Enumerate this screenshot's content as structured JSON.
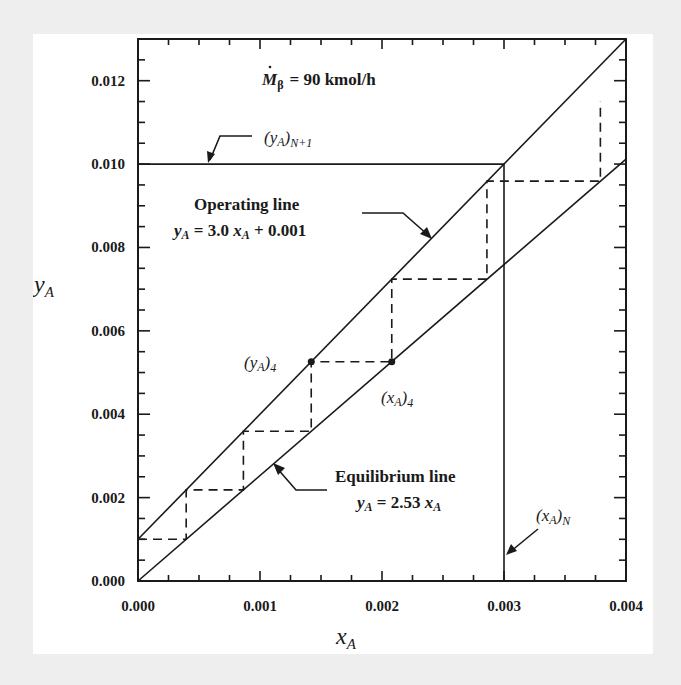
{
  "chart_data": {
    "type": "line",
    "title": "",
    "xlabel": "x_A",
    "ylabel": "y_A",
    "xlim": [
      0.0,
      0.004
    ],
    "ylim": [
      0.0,
      0.013
    ],
    "x_ticks": [
      "0.000",
      "0.001",
      "0.002",
      "0.003",
      "0.004"
    ],
    "y_ticks": [
      "0.000",
      "0.002",
      "0.004",
      "0.006",
      "0.008",
      "0.010",
      "0.012"
    ],
    "x_minor_step": 0.00025,
    "y_minor_step": 0.0005,
    "grid": false,
    "legend": null,
    "series": [
      {
        "name": "Operating line",
        "equation": "y_A = 3.0 x_A + 0.001",
        "style": "solid",
        "x": [
          0.0,
          0.004
        ],
        "y": [
          0.001,
          0.013
        ]
      },
      {
        "name": "Equilibrium line",
        "equation": "y_A = 2.53 x_A",
        "style": "solid",
        "x": [
          0.0,
          0.004
        ],
        "y": [
          0.0,
          0.01012
        ]
      },
      {
        "name": "(y_A)_N+1 inlet gas",
        "style": "solid",
        "x": [
          0.0,
          0.003
        ],
        "y": [
          0.01,
          0.01
        ]
      },
      {
        "name": "(x_A)_N outlet liquid",
        "style": "solid",
        "x": [
          0.003,
          0.003
        ],
        "y": [
          0.0,
          0.01
        ]
      },
      {
        "name": "Stage steps",
        "style": "dashed",
        "x": [
          0.0,
          0.000395,
          0.000395,
          0.000864,
          0.000864,
          0.00142,
          0.00142,
          0.00208,
          0.00208,
          0.00286,
          0.00286,
          0.00379,
          0.00379
        ],
        "y": [
          0.001,
          0.001,
          0.002186,
          0.002186,
          0.003592,
          0.003592,
          0.00526,
          0.00526,
          0.00724,
          0.00724,
          0.00959,
          0.00959,
          0.0115
        ]
      }
    ],
    "points": [
      {
        "label": "(y_A)_4",
        "x": 0.00142,
        "y": 0.00526
      },
      {
        "label": "(x_A)_4",
        "x": 0.00208,
        "y": 0.00526
      }
    ],
    "annotations": [
      "M_β = 90 kmol/h",
      "(y_A)_N+1",
      "Operating line",
      "y_A = 3.0 x_A + 0.001",
      "Equilibrium line",
      "y_A = 2.53 x_A",
      "(y_A)_4",
      "(x_A)_4",
      "(x_A)_N"
    ]
  },
  "labels": {
    "flow_M": "M",
    "flow_sub": "β",
    "flow_value": "=  90 kmol/h",
    "yN1_main": "(y",
    "yN1_A": "A",
    "yN1_close": ")",
    "yN1_sub": "N+1",
    "op_title": "Operating line",
    "op_eq_y": "y",
    "op_eq_A": "A",
    "op_eq_mid": " =  3.0 ",
    "op_eq_x": "x",
    "op_eq_A2": "A",
    "op_eq_tail": "  +  0.001",
    "eq_title": "Equilibrium line",
    "eq_eq_y": "y",
    "eq_eq_A": "A",
    "eq_eq_mid": " =  2.53 ",
    "eq_eq_x": "x",
    "eq_eq_A2": "A",
    "y4_open": "(y",
    "y4_A": "A",
    "y4_close": ")",
    "y4_sub": "4",
    "x4_open": "(x",
    "x4_A": "A",
    "x4_close": ")",
    "x4_sub": "4",
    "xN_open": "(x",
    "xN_A": "A",
    "xN_close": ")",
    "xN_sub": "N",
    "xlabel_main": "x",
    "xlabel_sub": "A",
    "ylabel_main": "y",
    "ylabel_sub": "A"
  },
  "colors": {
    "ink": "#1a1a1a",
    "panel": "#ffffff",
    "background": "#eeeeee"
  }
}
